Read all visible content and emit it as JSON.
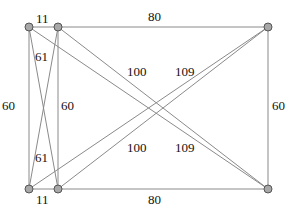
{
  "diagram": {
    "type": "weighted-graph",
    "nodes": [
      {
        "id": "A",
        "x": 29,
        "y": 27
      },
      {
        "id": "B",
        "x": 58,
        "y": 27
      },
      {
        "id": "C",
        "x": 268,
        "y": 27
      },
      {
        "id": "D",
        "x": 29,
        "y": 189
      },
      {
        "id": "E",
        "x": 58,
        "y": 189
      },
      {
        "id": "F",
        "x": 268,
        "y": 189
      }
    ],
    "edges": [
      {
        "from": "A",
        "to": "B",
        "weight": "11"
      },
      {
        "from": "B",
        "to": "C",
        "weight": "80"
      },
      {
        "from": "A",
        "to": "D",
        "weight": "60"
      },
      {
        "from": "B",
        "to": "E",
        "weight": "60"
      },
      {
        "from": "C",
        "to": "F",
        "weight": "60"
      },
      {
        "from": "D",
        "to": "E",
        "weight": "11"
      },
      {
        "from": "E",
        "to": "F",
        "weight": "80"
      },
      {
        "from": "A",
        "to": "E",
        "weight": "61"
      },
      {
        "from": "B",
        "to": "D",
        "weight": "61"
      },
      {
        "from": "B",
        "to": "F",
        "weight": "100"
      },
      {
        "from": "E",
        "to": "C",
        "weight": "100"
      },
      {
        "from": "A",
        "to": "F",
        "weight": "109"
      },
      {
        "from": "D",
        "to": "C",
        "weight": "109"
      }
    ],
    "labels": [
      {
        "text": "11",
        "x": 36,
        "y": 23
      },
      {
        "text": "80",
        "x": 148,
        "y": 21
      },
      {
        "text": "61",
        "x": 35,
        "y": 61
      },
      {
        "text": "100",
        "x": 127,
        "y": 76
      },
      {
        "text": "109",
        "x": 175,
        "y": 76
      },
      {
        "text": "60",
        "x": 2,
        "y": 110
      },
      {
        "text": "60",
        "x": 61,
        "y": 110
      },
      {
        "text": "60",
        "x": 272,
        "y": 110
      },
      {
        "text": "61",
        "x": 35,
        "y": 162
      },
      {
        "text": "100",
        "x": 127,
        "y": 152
      },
      {
        "text": "109",
        "x": 175,
        "y": 152
      },
      {
        "text": "11",
        "x": 36,
        "y": 204
      },
      {
        "text": "80",
        "x": 148,
        "y": 204
      }
    ]
  }
}
